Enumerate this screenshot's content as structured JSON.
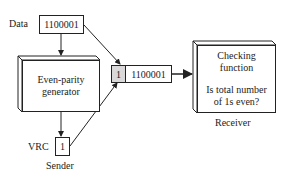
{
  "diagram": {
    "data_label": "Data",
    "data_value": "1100001",
    "generator": {
      "line1": "Even-parity",
      "line2": "generator"
    },
    "vrc_label": "VRC",
    "vrc_value": "1",
    "sender_label": "Sender",
    "frame": {
      "parity_bit": "1",
      "data_bits": "1100001"
    },
    "checker": {
      "line1": "Checking",
      "line2": "function",
      "line3": "Is total number",
      "line4": "of 1s even?"
    },
    "receiver_label": "Receiver",
    "colors": {
      "stroke": "#222222",
      "parity_cell_fill": "#d9d9d9",
      "background": "#ffffff"
    }
  }
}
